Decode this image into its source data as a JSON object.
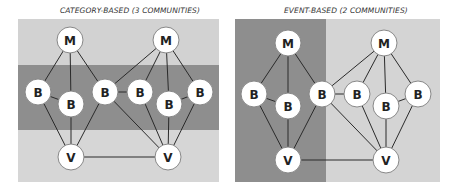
{
  "panels": [
    {
      "title": "CATEGORY-BASED (3 COMMUNITIES)",
      "title_pos": {
        "x": 60,
        "y": 4
      },
      "box": {
        "x": 18,
        "y": 19,
        "w": 201,
        "h": 163
      },
      "regions": [
        {
          "x": 18,
          "y": 19,
          "w": 201,
          "h": 46,
          "color": "#d2d2d2"
        },
        {
          "x": 18,
          "y": 65,
          "w": 201,
          "h": 65,
          "color": "#8e8e8e"
        },
        {
          "x": 18,
          "y": 130,
          "w": 201,
          "h": 52,
          "color": "#d6d6d6"
        }
      ],
      "nodes": [
        {
          "id": "M1",
          "label": "M",
          "x": 70,
          "y": 40
        },
        {
          "id": "M2",
          "label": "M",
          "x": 166,
          "y": 40
        },
        {
          "id": "B1",
          "label": "B",
          "x": 38,
          "y": 92
        },
        {
          "id": "B2",
          "label": "B",
          "x": 71,
          "y": 104
        },
        {
          "id": "B3",
          "label": "B",
          "x": 105,
          "y": 92
        },
        {
          "id": "B4",
          "label": "B",
          "x": 140,
          "y": 92
        },
        {
          "id": "B5",
          "label": "B",
          "x": 169,
          "y": 104
        },
        {
          "id": "B6",
          "label": "B",
          "x": 200,
          "y": 92
        },
        {
          "id": "V1",
          "label": "V",
          "x": 71,
          "y": 157
        },
        {
          "id": "V2",
          "label": "V",
          "x": 168,
          "y": 157
        }
      ],
      "edges": [
        [
          "M1",
          "B1"
        ],
        [
          "M1",
          "B2"
        ],
        [
          "M1",
          "B3"
        ],
        [
          "M2",
          "B3"
        ],
        [
          "M2",
          "B4"
        ],
        [
          "M2",
          "B5"
        ],
        [
          "M2",
          "B6"
        ],
        [
          "B1",
          "B2"
        ],
        [
          "B3",
          "B4"
        ],
        [
          "B5",
          "B6"
        ],
        [
          "B1",
          "V1"
        ],
        [
          "B2",
          "V1"
        ],
        [
          "B3",
          "V1"
        ],
        [
          "B3",
          "V2"
        ],
        [
          "B4",
          "V2"
        ],
        [
          "B5",
          "V2"
        ],
        [
          "B6",
          "V2"
        ],
        [
          "V1",
          "V2"
        ]
      ]
    },
    {
      "title": "EVENT-BASED (2 COMMUNITIES)",
      "title_pos": {
        "x": 284,
        "y": 4
      },
      "box": {
        "x": 235,
        "y": 19,
        "w": 205,
        "h": 163
      },
      "regions": [
        {
          "x": 235,
          "y": 19,
          "w": 91,
          "h": 163,
          "color": "#8e8e8e"
        },
        {
          "x": 326,
          "y": 19,
          "w": 114,
          "h": 163,
          "color": "#d4d4d4"
        }
      ],
      "nodes": [
        {
          "id": "M1",
          "label": "M",
          "x": 288,
          "y": 43
        },
        {
          "id": "M2",
          "label": "M",
          "x": 384,
          "y": 43
        },
        {
          "id": "B1",
          "label": "B",
          "x": 254,
          "y": 94
        },
        {
          "id": "B2",
          "label": "B",
          "x": 288,
          "y": 106
        },
        {
          "id": "B3",
          "label": "B",
          "x": 322,
          "y": 94
        },
        {
          "id": "B4",
          "label": "B",
          "x": 357,
          "y": 94
        },
        {
          "id": "B5",
          "label": "B",
          "x": 386,
          "y": 106
        },
        {
          "id": "B6",
          "label": "B",
          "x": 418,
          "y": 94
        },
        {
          "id": "V1",
          "label": "V",
          "x": 288,
          "y": 160
        },
        {
          "id": "V2",
          "label": "V",
          "x": 386,
          "y": 160
        }
      ],
      "edges": [
        [
          "M1",
          "B1"
        ],
        [
          "M1",
          "B2"
        ],
        [
          "M1",
          "B3"
        ],
        [
          "M2",
          "B3"
        ],
        [
          "M2",
          "B4"
        ],
        [
          "M2",
          "B5"
        ],
        [
          "M2",
          "B6"
        ],
        [
          "B1",
          "B2"
        ],
        [
          "B3",
          "B4"
        ],
        [
          "B5",
          "B6"
        ],
        [
          "B1",
          "V1"
        ],
        [
          "B2",
          "V1"
        ],
        [
          "B3",
          "V1"
        ],
        [
          "B3",
          "V2"
        ],
        [
          "B4",
          "V2"
        ],
        [
          "B5",
          "V2"
        ],
        [
          "B6",
          "V2"
        ],
        [
          "V1",
          "V2"
        ]
      ]
    }
  ],
  "style": {
    "node_radius": 13,
    "node_fill": "#ffffff",
    "node_stroke": "#888888",
    "edge_color": "#2a2a2a"
  }
}
